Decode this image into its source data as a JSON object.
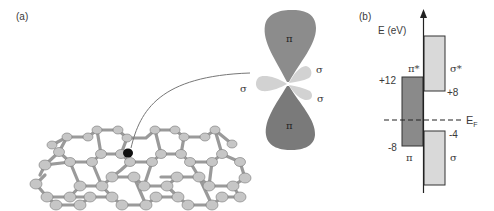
{
  "panel_a": {
    "label": "(a)",
    "orbital_labels": {
      "pi_top": "π",
      "pi_bottom": "π",
      "sigma_left": "σ",
      "sigma_upper_right": "σ",
      "sigma_lower_right": "σ"
    },
    "colors": {
      "pi_lobe": "#8c8c8c",
      "pi_lobe_bottom": "#7a7a7a",
      "sigma_lobe": "#d4d4d4",
      "atom": "#c4c4c4",
      "highlight_atom": "#111111"
    }
  },
  "panel_b": {
    "label": "(b)",
    "axis_label": "E (eV)",
    "fermi_label": "E",
    "fermi_sub": "F",
    "bands": [
      {
        "name": "π",
        "label": "π",
        "top_label": "π*",
        "top_value": "+12",
        "bottom_value": "-8",
        "color": "#8a8a8a"
      },
      {
        "name": "σ*",
        "label": "σ*",
        "bottom_value": "+8",
        "color": "#d9d9d9"
      },
      {
        "name": "σ",
        "label": "σ",
        "top_value": "-4",
        "color": "#d9d9d9"
      }
    ]
  }
}
